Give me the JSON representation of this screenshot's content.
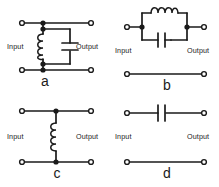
{
  "figure": {
    "background_color": "#ffffff",
    "line_color": "#1a1a1a",
    "panel_count": 4
  },
  "panels": [
    {
      "id": "a",
      "caption": "a",
      "input_label": "Input",
      "output_label": "Output",
      "topology": "shunt parallel LC resonant tank between top rail and bottom rail",
      "components": [
        "inductor",
        "capacitor"
      ],
      "components_detail": [
        {
          "name": "inductor",
          "symbol": "coil",
          "orientation": "vertical",
          "coil_bumps": 4
        },
        {
          "name": "capacitor",
          "symbol": "parallel-plates",
          "orientation": "horizontal-plates"
        }
      ],
      "rails": [
        "top",
        "bottom"
      ],
      "junction_dots": 4,
      "terminals": 4
    },
    {
      "id": "b",
      "caption": "b",
      "input_label": "Input",
      "output_label": "Output",
      "topology": "series parallel LC resonant tank in the top rail; bottom rail is a plain wire",
      "components": [
        "inductor",
        "capacitor"
      ],
      "components_detail": [
        {
          "name": "inductor",
          "symbol": "coil",
          "orientation": "horizontal",
          "coil_bumps": 4
        },
        {
          "name": "capacitor",
          "symbol": "parallel-plates",
          "orientation": "vertical-plates"
        }
      ],
      "rails": [
        "top",
        "bottom"
      ],
      "junction_dots": 2,
      "terminals": 4
    },
    {
      "id": "c",
      "caption": "c",
      "input_label": "Input",
      "output_label": "Output",
      "topology": "shunt inductor between top rail and bottom rail",
      "components": [
        "inductor"
      ],
      "components_detail": [
        {
          "name": "inductor",
          "symbol": "coil",
          "orientation": "vertical",
          "coil_bumps": 4
        }
      ],
      "rails": [
        "top",
        "bottom"
      ],
      "junction_dots": 2,
      "terminals": 4
    },
    {
      "id": "d",
      "caption": "d",
      "input_label": "Input",
      "output_label": "Output",
      "topology": "series capacitor in the top rail; bottom rail is a plain wire",
      "components": [
        "capacitor"
      ],
      "components_detail": [
        {
          "name": "capacitor",
          "symbol": "parallel-plates",
          "orientation": "vertical-plates"
        }
      ],
      "rails": [
        "top",
        "bottom"
      ],
      "junction_dots": 0,
      "terminals": 4
    }
  ]
}
